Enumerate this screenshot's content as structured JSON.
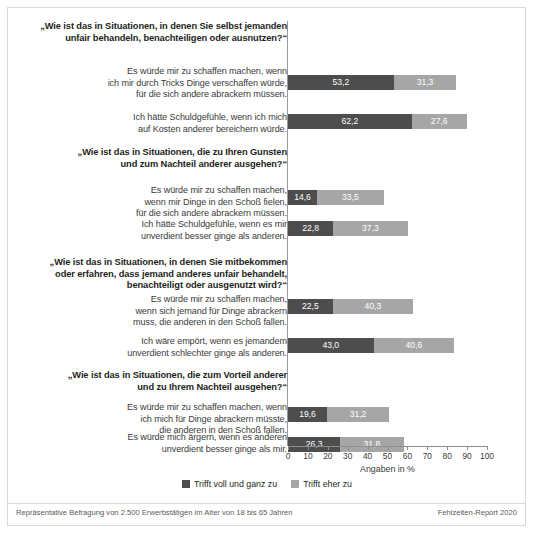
{
  "chart_data": {
    "type": "bar",
    "orientation": "horizontal",
    "stacked": true,
    "title": "",
    "xlabel": "Angaben in %",
    "ylabel": "",
    "xlim": [
      0,
      100
    ],
    "xticks": [
      0,
      10,
      20,
      30,
      40,
      50,
      60,
      70,
      80,
      90,
      100
    ],
    "grid": false,
    "legend_position": "bottom",
    "series": [
      {
        "name": "Trifft voll und ganz zu",
        "color": "#4d4d4d",
        "values": [
          53.2,
          62.2,
          14.6,
          22.8,
          22.5,
          43.0,
          19.6,
          26.3
        ]
      },
      {
        "name": "Trifft eher zu",
        "color": "#a6a6a6",
        "values": [
          31.3,
          27.6,
          33.5,
          37.3,
          40.3,
          40.6,
          31.2,
          31.8
        ]
      }
    ],
    "value_labels": {
      "dark": [
        "53,2",
        "62,2",
        "14,6",
        "22,8",
        "22,5",
        "43,0",
        "19,6",
        "26,3"
      ],
      "light": [
        "31,3",
        "27,6",
        "33,5",
        "37,3",
        "40,3",
        "40,6",
        "31,2",
        "31,8"
      ]
    },
    "categories": [
      "Es würde mir zu schaffen machen, wenn ich mir durch Tricks Dinge verschaffen würde, für die sich andere abrackern müssen.",
      "Ich hätte Schuldgefühle, wenn ich mich auf Kosten anderer bereichern würde.",
      "Es würde mir zu schaffen machen, wenn mir Dinge in den Schoß fielen, für die sich andere abrackern müssen.",
      "Ich hätte Schuldgefühle, wenn es mir unverdient besser ginge als anderen.",
      "Es würde mir zu schaffen machen, wenn sich jemand für Dinge abrackern muss, die anderen in den Schoß fallen.",
      "Ich wäre empört, wenn es jemandem unverdient schlechter ginge als anderen.",
      "Es würde mir zu schaffen machen, wenn ich mich für Dinge abrackern müsste, die anderen in den Schoß fallen.",
      "Es würde mich ärgern, wenn es anderen unverdient besser ginge als mir."
    ]
  },
  "groups": [
    {
      "title_line1": "„Wie ist das in Situationen, in denen Sie selbst jemanden",
      "title_line2": "unfair behandeln, benachteiligen oder ausnutzen?“",
      "items": [
        {
          "lines": [
            "Es würde mir zu schaffen machen, wenn",
            "ich mir durch Tricks Dinge verschaffen würde,",
            "für die sich andere abrackern müssen."
          ],
          "dark": 53.2,
          "light": 31.3,
          "dark_label": "53,2",
          "light_label": "31,3"
        },
        {
          "lines": [
            "Ich hätte Schuldgefühle, wenn ich mich",
            "auf Kosten anderer bereichern würde."
          ],
          "dark": 62.2,
          "light": 27.6,
          "dark_label": "62,2",
          "light_label": "27,6"
        }
      ]
    },
    {
      "title_line1": "„Wie ist das in Situationen, die zu Ihren Gunsten",
      "title_line2": "und zum Nachteil anderer ausgehen?“",
      "items": [
        {
          "lines": [
            "Es würde mir zu schaffen machen,",
            "wenn mir Dinge in den Schoß fielen,",
            "für die sich andere abrackern müssen."
          ],
          "dark": 14.6,
          "light": 33.5,
          "dark_label": "14,6",
          "light_label": "33,5"
        },
        {
          "lines": [
            "Ich hätte Schuldgefühle, wenn es mir",
            "unverdient besser ginge als anderen."
          ],
          "dark": 22.8,
          "light": 37.3,
          "dark_label": "22,8",
          "light_label": "37,3"
        }
      ]
    },
    {
      "title_line1": "„Wie ist das in Situationen, in denen Sie mitbekommen",
      "title_line2": "oder erfahren, dass jemand anderes unfair behandelt,",
      "title_line3": "benachteiligt oder ausgenutzt wird?“",
      "items": [
        {
          "lines": [
            "Es würde mir zu schaffen machen,",
            "wenn sich jemand für Dinge abrackern",
            "muss, die anderen in den Schoß fallen."
          ],
          "dark": 22.5,
          "light": 40.3,
          "dark_label": "22,5",
          "light_label": "40,3"
        },
        {
          "lines": [
            "Ich wäre empört, wenn es jemandem",
            "unverdient schlechter ginge als anderen."
          ],
          "dark": 43.0,
          "light": 40.6,
          "dark_label": "43,0",
          "light_label": "40,6"
        }
      ]
    },
    {
      "title_line1": "„Wie ist das in Situationen, die zum Vorteil anderer",
      "title_line2": "und zu Ihrem Nachteil ausgehen?“",
      "items": [
        {
          "lines": [
            "Es würde mir zu schaffen machen, wenn",
            "ich mich für Dinge abrackern müsste,",
            "die anderen in den Schoß fallen."
          ],
          "dark": 19.6,
          "light": 31.2,
          "dark_label": "19,6",
          "light_label": "31,2"
        },
        {
          "lines": [
            "Es würde mich ärgern, wenn es anderen",
            "unverdient besser ginge als mir."
          ],
          "dark": 26.3,
          "light": 31.8,
          "dark_label": "26,3",
          "light_label": "31,8"
        }
      ]
    }
  ],
  "axis": {
    "ticks": [
      "0",
      "10",
      "20",
      "30",
      "40",
      "50",
      "60",
      "70",
      "80",
      "90",
      "100"
    ],
    "title": "Angaben in %"
  },
  "legend": {
    "items": [
      {
        "label": "Trifft voll und ganz zu",
        "color": "#4d4d4d"
      },
      {
        "label": "Trifft eher zu",
        "color": "#a6a6a6"
      }
    ]
  },
  "footer": {
    "left": "Repräsentative Befragung von 2.500 Erwerbstätigen im Alter von 18 bis 65 Jahren",
    "right": "Fehlzeiten-Report 2020"
  }
}
